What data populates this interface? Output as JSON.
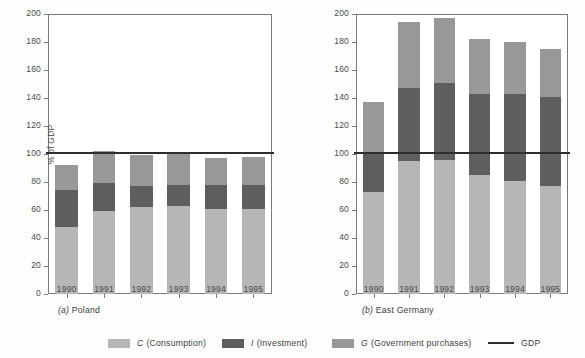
{
  "chart_data": [
    {
      "type": "bar",
      "subtype": "stacked",
      "panel_id": "a",
      "panel_label": "(a)",
      "title": "Poland",
      "xlabel": "",
      "ylabel": "% of GDP",
      "ylim": [
        0,
        200
      ],
      "yticks": [
        0,
        20,
        40,
        60,
        80,
        100,
        120,
        140,
        160,
        180,
        200
      ],
      "grid": false,
      "legend_position": "bottom",
      "categories": [
        "1990",
        "1991",
        "1992",
        "1993",
        "1994",
        "1995"
      ],
      "series": [
        {
          "name": "C (Consumption)",
          "key": "C",
          "color": "#b6b6b6",
          "values": [
            48,
            59,
            62,
            63,
            61,
            61
          ]
        },
        {
          "name": "I (Investment)",
          "key": "I",
          "color": "#5e5e5e",
          "values": [
            26,
            20,
            15,
            15,
            17,
            17
          ]
        },
        {
          "name": "G (Government purchases)",
          "key": "G",
          "color": "#989898",
          "values": [
            18,
            23,
            22,
            22,
            19,
            20
          ]
        }
      ],
      "totals": [
        92,
        102,
        99,
        100,
        97,
        98
      ],
      "reference_line": {
        "name": "GDP",
        "value": 100,
        "color": "#2e2e2e"
      }
    },
    {
      "type": "bar",
      "subtype": "stacked",
      "panel_id": "b",
      "panel_label": "(b)",
      "title": "East Germany",
      "xlabel": "",
      "ylabel": "% of GDP",
      "ylim": [
        0,
        200
      ],
      "yticks": [
        0,
        20,
        40,
        60,
        80,
        100,
        120,
        140,
        160,
        180,
        200
      ],
      "grid": false,
      "legend_position": "bottom",
      "categories": [
        "1990",
        "1991",
        "1992",
        "1993",
        "1994",
        "1995"
      ],
      "series": [
        {
          "name": "C (Consumption)",
          "key": "C",
          "color": "#b6b6b6",
          "values": [
            73,
            95,
            96,
            85,
            81,
            77
          ]
        },
        {
          "name": "I (Investment)",
          "key": "I",
          "color": "#5e5e5e",
          "values": [
            27,
            52,
            55,
            58,
            62,
            64
          ]
        },
        {
          "name": "G (Government purchases)",
          "key": "G",
          "color": "#989898",
          "values": [
            37,
            47,
            46,
            39,
            37,
            34
          ]
        }
      ],
      "totals": [
        137,
        194,
        197,
        182,
        180,
        175
      ],
      "reference_line": {
        "name": "GDP",
        "value": 100,
        "color": "#2e2e2e"
      }
    }
  ],
  "axis": {
    "ylabel": "% of GDP",
    "ytick_labels": [
      "0",
      "20",
      "40",
      "60",
      "80",
      "100",
      "120",
      "140",
      "160",
      "180",
      "200"
    ],
    "xtick_labels": [
      "1990",
      "1991",
      "1992",
      "1993",
      "1994",
      "1995"
    ]
  },
  "panels": [
    {
      "label": "(a)",
      "name": "Poland"
    },
    {
      "label": "(b)",
      "name": "East Germany"
    }
  ],
  "legend": {
    "items": [
      {
        "symbol": "C",
        "text": "(Consumption)",
        "swatch": "#b6b6b6",
        "kind": "swatch"
      },
      {
        "symbol": "I",
        "text": "(Investment)",
        "swatch": "#5e5e5e",
        "kind": "swatch"
      },
      {
        "symbol": "G",
        "text": "(Government purchases)",
        "swatch": "#989898",
        "kind": "swatch"
      },
      {
        "symbol": "",
        "text": "GDP",
        "swatch": "#2e2e2e",
        "kind": "line"
      }
    ]
  },
  "colors": {
    "consumption": "#b6b6b6",
    "investment": "#5e5e5e",
    "government": "#989898",
    "gdp_line": "#2e2e2e",
    "axis": "#7a7a7a",
    "text": "#4a4a4a",
    "background": "#ffffff"
  }
}
